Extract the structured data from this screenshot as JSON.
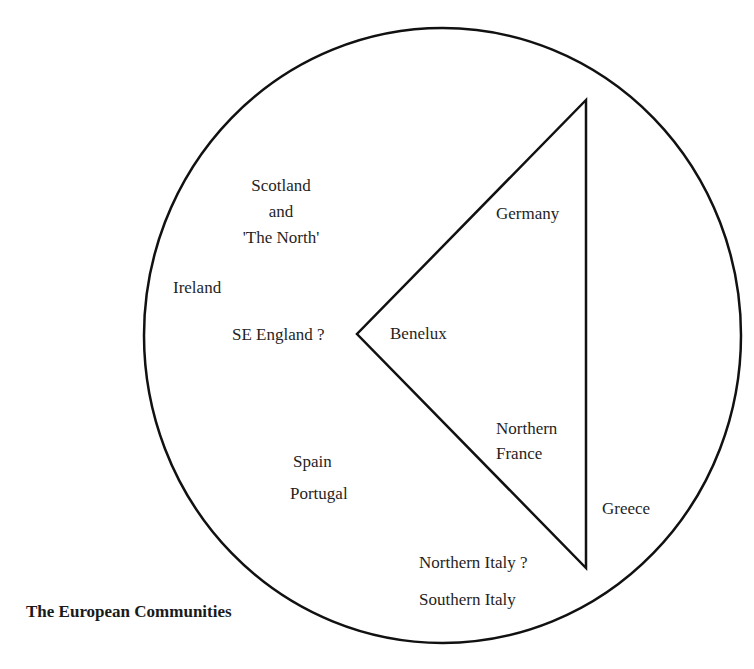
{
  "title": "The European Communities",
  "shapes": {
    "circle": {
      "cx": 442.5,
      "cy": 335.5,
      "rx": 298.5,
      "ry": 307.5,
      "stroke": "#111111",
      "stroke_width": 2.5
    },
    "triangle": {
      "points": "586,100 357,334 586,568",
      "stroke": "#111111",
      "stroke_width": 2.5
    }
  },
  "labels": {
    "scotland": {
      "lines": [
        "Scotland",
        "and",
        "'The North'"
      ]
    },
    "ireland": "Ireland",
    "se_england": "SE England ?",
    "benelux": "Benelux",
    "germany": "Germany",
    "northern_france": {
      "lines": [
        "Northern",
        "France"
      ]
    },
    "spain": "Spain",
    "portugal": "Portugal",
    "greece": "Greece",
    "northern_italy": "Northern Italy ?",
    "southern_italy": "Southern Italy"
  }
}
